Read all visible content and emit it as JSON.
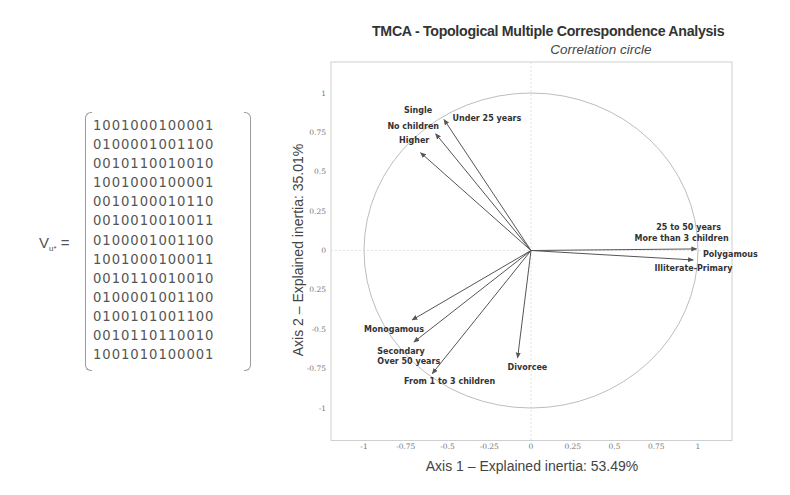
{
  "matrix": {
    "label_main": "V",
    "label_sub": "u*",
    "label_eq": " =",
    "rows": [
      "1001000100001",
      "0100001001100",
      "0010110010010",
      "1001000100001",
      "0010100010110",
      "0010010010011",
      "0100001001100",
      "1001000100011",
      "0010110010010",
      "0100001001100",
      "0100101001100",
      "0010110110010",
      "1001010100001"
    ]
  },
  "chart_data": {
    "type": "scatter",
    "subtype": "correlation-circle-vectors",
    "title": "TMCA - Topological Multiple Correspondence Analysis",
    "subtitle": "Correlation circle",
    "xlabel": "Axis 1 – Explained inertia: 53.49%",
    "ylabel": "Axis 2 – Explained inertia: 35.01%",
    "xlim": [
      -1.2,
      1.2
    ],
    "ylim": [
      -1.2,
      1.2
    ],
    "x_ticks": [
      {
        "value": -1,
        "label": "-1"
      },
      {
        "value": -0.75,
        "label": "-0.75"
      },
      {
        "value": -0.5,
        "label": "-0.5"
      },
      {
        "value": -0.25,
        "label": "-0.25"
      },
      {
        "value": 0,
        "label": "0"
      },
      {
        "value": 0.25,
        "label": "0.25"
      },
      {
        "value": 0.5,
        "label": "0.5"
      },
      {
        "value": 0.75,
        "label": "0.75"
      },
      {
        "value": 1,
        "label": "1"
      }
    ],
    "y_ticks": [
      {
        "value": 1,
        "label": "1"
      },
      {
        "value": 0.75,
        "label": "0.75"
      },
      {
        "value": 0.5,
        "label": "0.5"
      },
      {
        "value": 0.25,
        "label": "0.25"
      },
      {
        "value": 0,
        "label": "0"
      },
      {
        "value": -0.25,
        "label": "0.25"
      },
      {
        "value": -0.5,
        "label": "-0.5"
      },
      {
        "value": -0.75,
        "label": "-0.75"
      },
      {
        "value": -1,
        "label": "-1"
      }
    ],
    "circle_radius": 1,
    "grid": false,
    "legend": "none",
    "vectors": [
      {
        "x": -0.52,
        "y": 0.83,
        "labels": [
          {
            "text": "Single",
            "dx": -0.24,
            "dy": 0.06
          },
          {
            "text": "Under 25 years",
            "dx": 0.05,
            "dy": 0.01
          }
        ]
      },
      {
        "x": -0.57,
        "y": 0.74,
        "labels": [
          {
            "text": "No children",
            "dx": -0.29,
            "dy": 0.05
          }
        ]
      },
      {
        "x": -0.66,
        "y": 0.62,
        "labels": [
          {
            "text": "Higher",
            "dx": -0.13,
            "dy": 0.08
          }
        ]
      },
      {
        "x": 0.99,
        "y": 0.01,
        "labels": [
          {
            "text": "25 to 50 years",
            "dx": -0.24,
            "dy": 0.14
          },
          {
            "text": "More than 3 children",
            "dx": -0.37,
            "dy": 0.07
          },
          {
            "text": "Polygamous",
            "dx": 0.04,
            "dy": -0.03
          }
        ]
      },
      {
        "x": 0.97,
        "y": -0.06,
        "labels": [
          {
            "text": "Illiterate-Primary",
            "dx": -0.23,
            "dy": -0.05
          }
        ]
      },
      {
        "x": -0.71,
        "y": -0.44,
        "labels": [
          {
            "text": "Monogamous",
            "dx": -0.29,
            "dy": -0.06
          }
        ]
      },
      {
        "x": -0.7,
        "y": -0.58,
        "labels": [
          {
            "text": "Secondary",
            "dx": -0.22,
            "dy": -0.06
          }
        ]
      },
      {
        "x": -0.59,
        "y": -0.78,
        "labels": [
          {
            "text": "Over 50 years",
            "dx": -0.33,
            "dy": 0.08
          },
          {
            "text": "From 1 to 3 children",
            "dx": -0.17,
            "dy": -0.05
          }
        ]
      },
      {
        "x": -0.08,
        "y": -0.68,
        "labels": [
          {
            "text": "Divorcee",
            "dx": -0.06,
            "dy": -0.06
          }
        ]
      }
    ]
  },
  "colors": {
    "arrow": "#555555",
    "circle": "#bdbdbd",
    "frame": "#cfcfcf",
    "text": "#333333"
  }
}
